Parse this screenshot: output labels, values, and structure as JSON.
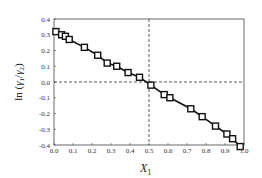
{
  "chart_data": {
    "type": "line",
    "title": "",
    "xlabel": "X1",
    "ylabel": "ln (γ1/γ2)",
    "xlim": [
      0.0,
      1.0
    ],
    "ylim": [
      -0.4,
      0.4
    ],
    "xticks": [
      "0.0",
      "0.1",
      "0.2",
      "0.3",
      "0.4",
      "0.5",
      "0.6",
      "0.7",
      "0.8",
      "0.9",
      "1.0"
    ],
    "yticks": [
      "0.4",
      "0.3",
      "0.2",
      "0.1",
      "0.0",
      "-0.1",
      "-0.2",
      "-0.3",
      "-0.4"
    ],
    "grid": false,
    "reference_lines": {
      "horizontal_y": 0.0,
      "vertical_x": 0.5,
      "style": "dashed"
    },
    "marker": "open-square",
    "series": [
      {
        "name": "ln(γ1/γ2)",
        "x": [
          0.01,
          0.04,
          0.06,
          0.08,
          0.16,
          0.23,
          0.28,
          0.33,
          0.39,
          0.45,
          0.51,
          0.58,
          0.61,
          0.72,
          0.78,
          0.85,
          0.91,
          0.94,
          0.98
        ],
        "y": [
          0.32,
          0.3,
          0.29,
          0.27,
          0.22,
          0.17,
          0.12,
          0.1,
          0.06,
          0.03,
          -0.02,
          -0.08,
          -0.1,
          -0.17,
          -0.22,
          -0.28,
          -0.33,
          -0.36,
          -0.41
        ]
      }
    ]
  }
}
